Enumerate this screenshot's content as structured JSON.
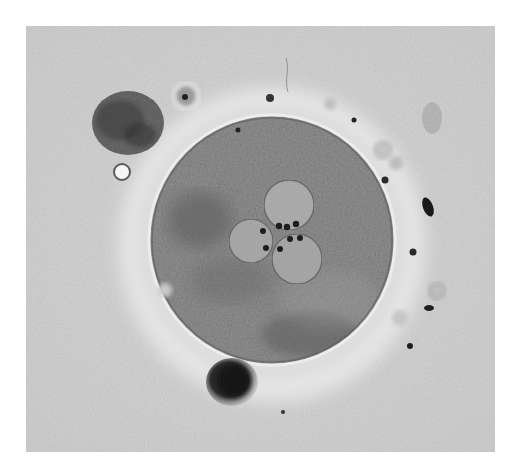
{
  "image": {
    "description": "Phase-contrast micrograph of a zygote/oocyte showing three pronuclei with nucleoli, surrounded by zona pellucida and cumulus/corona debris",
    "subject": "tripronuclear zygote",
    "modality": "light microscopy (grayscale)"
  },
  "colors": {
    "page_background": "#ffffff",
    "field_background": "#d4d4d4",
    "field_light": "#e6e6e6",
    "zona_halo": "#e9e9e9",
    "cytoplasm": "#8e8e8e",
    "cytoplasm_dark": "#6a6a6a",
    "pronucleus": "#b2b2b2",
    "nucleolus": "#222222",
    "membrane_highlight": "#f2f2f2",
    "debris_dark": "#3a3a3a",
    "polar_body": "#1c1c1c"
  },
  "features": {
    "pronuclei_count": 3,
    "labels": [
      "zona-pellucida",
      "cytoplasm",
      "pronucleus",
      "nucleolus",
      "debris-cluster",
      "polar-body",
      "sperm-cell"
    ]
  }
}
